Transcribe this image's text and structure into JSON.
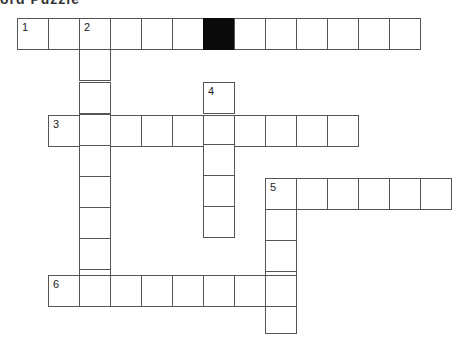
{
  "title": "ord Puzzle",
  "cell_size": 31,
  "colors": {
    "border": "#555555",
    "block": "#0a0a0a",
    "background": "#ffffff"
  },
  "entries": [
    {
      "number": "1",
      "direction": "across",
      "length": 13,
      "x": 17,
      "y": 18,
      "block_indices": [
        6
      ]
    },
    {
      "number": "2",
      "direction": "down",
      "length": 9,
      "x": 79,
      "y": 18
    },
    {
      "number": "3",
      "direction": "across",
      "length": 10,
      "x": 48,
      "y": 115
    },
    {
      "number": "4",
      "direction": "down",
      "length": 5,
      "x": 203,
      "y": 82
    },
    {
      "number": "5",
      "direction": "across",
      "length": 6,
      "x": 265,
      "y": 178
    },
    {
      "number": "5",
      "direction": "down",
      "length": 5,
      "x": 265,
      "y": 178
    },
    {
      "number": "6",
      "direction": "across",
      "length": 8,
      "x": 48,
      "y": 275
    }
  ]
}
